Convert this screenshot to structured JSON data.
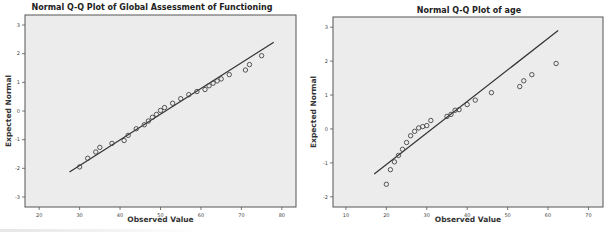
{
  "chart_data": [
    {
      "type": "scatter",
      "title": "Normal Q-Q Plot of Global Assessment of Functioning",
      "xlabel": "Observed Value",
      "ylabel": "Expected Normal",
      "xlim": [
        16.5,
        83.5
      ],
      "ylim": [
        -3.35,
        3.35
      ],
      "xticks": [
        20,
        30,
        40,
        50,
        60,
        70,
        80
      ],
      "yticks": [
        3,
        2,
        1,
        0,
        -1,
        -2,
        -3
      ],
      "grid": false,
      "legend": null,
      "reference_line": {
        "x": [
          27.5,
          78
        ],
        "y": [
          -2.13,
          2.4
        ]
      },
      "points": {
        "x": [
          30,
          32,
          34,
          35,
          38,
          41,
          42,
          44,
          46,
          47,
          48,
          49,
          50,
          51,
          53,
          55,
          57,
          59,
          61,
          62,
          63,
          64,
          65,
          67,
          71,
          72,
          75
        ],
        "y": [
          -1.95,
          -1.65,
          -1.43,
          -1.27,
          -1.13,
          -1.03,
          -0.85,
          -0.62,
          -0.48,
          -0.35,
          -0.22,
          -0.12,
          0.02,
          0.12,
          0.27,
          0.43,
          0.57,
          0.68,
          0.75,
          0.88,
          0.97,
          1.05,
          1.12,
          1.27,
          1.43,
          1.62,
          1.93
        ]
      }
    },
    {
      "type": "scatter",
      "title": "Normal Q-Q Plot of age",
      "xlabel": "Observed Value",
      "ylabel": "Expected Normal",
      "xlim": [
        6.8,
        73.6
      ],
      "ylim": [
        -2.3,
        3.3
      ],
      "xticks": [
        10,
        20,
        30,
        40,
        50,
        60,
        70
      ],
      "yticks": [
        3,
        2,
        1,
        0,
        -1,
        -2
      ],
      "grid": false,
      "legend": null,
      "reference_line": {
        "x": [
          17,
          62.5
        ],
        "y": [
          -1.33,
          2.9
        ]
      },
      "points": {
        "x": [
          20,
          21,
          22,
          23,
          24,
          25,
          26,
          27,
          28,
          29,
          30,
          31,
          35,
          36,
          37,
          38,
          40,
          42,
          46,
          53,
          54,
          56,
          62
        ],
        "y": [
          -1.63,
          -1.2,
          -0.97,
          -0.78,
          -0.6,
          -0.4,
          -0.2,
          -0.07,
          0.03,
          0.07,
          0.1,
          0.25,
          0.37,
          0.43,
          0.55,
          0.57,
          0.72,
          0.85,
          1.07,
          1.25,
          1.42,
          1.6,
          1.93
        ]
      }
    }
  ],
  "layout": {
    "panels": [
      {
        "frame": {
          "x0": 25,
          "x1": 296,
          "y0": 15,
          "y1": 207
        },
        "title_x": 152,
        "title_y": 10
      },
      {
        "frame": {
          "x0": 28,
          "x1": 298,
          "y0": 17,
          "y1": 207
        },
        "title_x": 164,
        "title_y": 13
      }
    ],
    "colors": {
      "plot_bg": "#ececec",
      "frame": "#555555",
      "marker": "#444444",
      "line": "#333333"
    }
  }
}
